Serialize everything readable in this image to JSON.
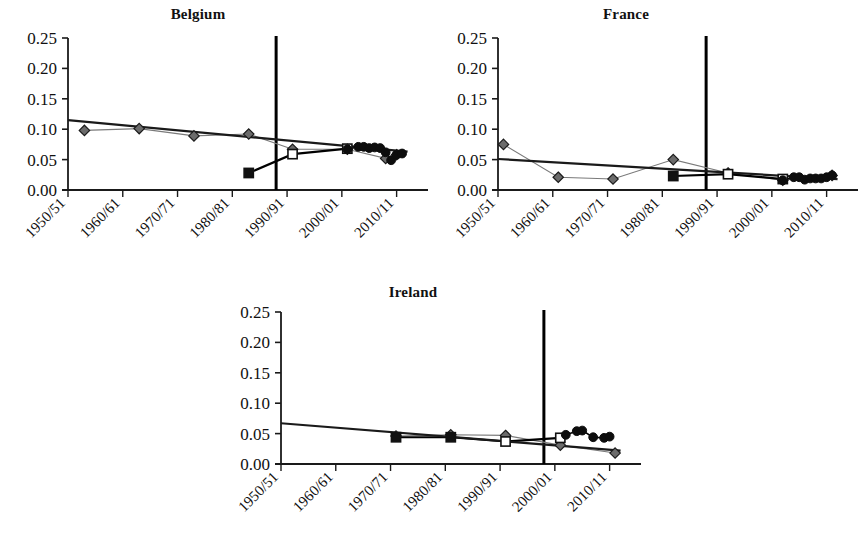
{
  "figure": {
    "panels": [
      {
        "id": "belgium",
        "title": "Belgium",
        "vline_year": "1988/89"
      },
      {
        "id": "france",
        "title": "France",
        "vline_year": "1988/89"
      },
      {
        "id": "ireland",
        "title": "Ireland",
        "vline_year": "1998/99"
      }
    ],
    "y_tick_labels": [
      "0.25",
      "0.20",
      "0.15",
      "0.10",
      "0.05",
      "0.00"
    ],
    "x_tick_labels": [
      "1950/51",
      "1960/61",
      "1970/71",
      "1980/81",
      "1990/91",
      "2000/01",
      "2010/11"
    ]
  },
  "chart_data": [
    {
      "type": "line",
      "title": "Belgium",
      "xlabel": "",
      "ylabel": "",
      "ylim": [
        0.0,
        0.25
      ],
      "yticks": [
        0.0,
        0.05,
        0.1,
        0.15,
        0.2,
        0.25
      ],
      "xlim": [
        1950,
        2015
      ],
      "xticks": [
        1950,
        1960,
        1970,
        1980,
        1990,
        2000,
        2010
      ],
      "xtick_labels": [
        "1950/51",
        "1960/61",
        "1970/71",
        "1980/81",
        "1990/91",
        "2000/01",
        "2010/11"
      ],
      "grid": false,
      "legend": "none",
      "annotations": [
        {
          "type": "vline",
          "x": 1988,
          "label": "structural break"
        }
      ],
      "series": [
        {
          "name": "diamond-series",
          "marker": "diamond",
          "color": "#555555",
          "x": [
            1953,
            1963,
            1973,
            1983,
            1991,
            2001,
            2008,
            2010
          ],
          "values": [
            0.098,
            0.101,
            0.089,
            0.092,
            0.067,
            0.067,
            0.052,
            0.058
          ]
        },
        {
          "name": "square-series",
          "marker": "square",
          "color": "#000000",
          "x": [
            1983,
            1991,
            2001
          ],
          "values": [
            0.028,
            0.059,
            0.068
          ]
        },
        {
          "name": "circle-series",
          "marker": "circle",
          "color": "#000000",
          "x": [
            2001,
            2003,
            2004,
            2005,
            2006,
            2007,
            2008,
            2009,
            2010,
            2011
          ],
          "values": [
            0.067,
            0.071,
            0.071,
            0.069,
            0.07,
            0.069,
            0.062,
            0.049,
            0.058,
            0.06
          ]
        },
        {
          "name": "trend-line",
          "marker": "none",
          "color": "#1a1a1a",
          "x": [
            1950,
            2012
          ],
          "values": [
            0.115,
            0.063
          ]
        }
      ]
    },
    {
      "type": "line",
      "title": "France",
      "xlabel": "",
      "ylabel": "",
      "ylim": [
        0.0,
        0.25
      ],
      "yticks": [
        0.0,
        0.05,
        0.1,
        0.15,
        0.2,
        0.25
      ],
      "xlim": [
        1950,
        2015
      ],
      "xticks": [
        1950,
        1960,
        1970,
        1980,
        1990,
        2000,
        2010
      ],
      "xtick_labels": [
        "1950/51",
        "1960/61",
        "1970/71",
        "1980/81",
        "1990/91",
        "2000/01",
        "2010/11"
      ],
      "grid": false,
      "legend": "none",
      "annotations": [
        {
          "type": "vline",
          "x": 1988,
          "label": "structural break"
        }
      ],
      "series": [
        {
          "name": "diamond-series",
          "marker": "diamond",
          "color": "#555555",
          "x": [
            1951,
            1961,
            1971,
            1982,
            1992,
            2002,
            2011
          ],
          "values": [
            0.075,
            0.021,
            0.018,
            0.05,
            0.028,
            0.016,
            0.024
          ]
        },
        {
          "name": "square-series",
          "marker": "square",
          "color": "#000000",
          "x": [
            1982,
            1992,
            2002
          ],
          "values": [
            0.023,
            0.026,
            0.018
          ]
        },
        {
          "name": "circle-series",
          "marker": "circle",
          "color": "#000000",
          "x": [
            2002,
            2004,
            2005,
            2006,
            2007,
            2008,
            2009,
            2010,
            2011
          ],
          "values": [
            0.016,
            0.021,
            0.021,
            0.017,
            0.019,
            0.019,
            0.019,
            0.021,
            0.024
          ]
        },
        {
          "name": "trend-line",
          "marker": "none",
          "color": "#1a1a1a",
          "x": [
            1950,
            2012
          ],
          "values": [
            0.051,
            0.018
          ]
        }
      ]
    },
    {
      "type": "line",
      "title": "Ireland",
      "xlabel": "",
      "ylabel": "",
      "ylim": [
        0.0,
        0.25
      ],
      "yticks": [
        0.0,
        0.05,
        0.1,
        0.15,
        0.2,
        0.25
      ],
      "xlim": [
        1950,
        2015
      ],
      "xticks": [
        1950,
        1960,
        1970,
        1980,
        1990,
        2000,
        2010
      ],
      "xtick_labels": [
        "1950/51",
        "1960/61",
        "1970/71",
        "1980/81",
        "1990/91",
        "2000/01",
        "2010/11"
      ],
      "grid": false,
      "legend": "none",
      "annotations": [
        {
          "type": "vline",
          "x": 1998,
          "label": "structural break"
        }
      ],
      "series": [
        {
          "name": "diamond-series",
          "marker": "diamond",
          "color": "#555555",
          "x": [
            1971,
            1981,
            1991,
            2001,
            2011
          ],
          "values": [
            0.046,
            0.048,
            0.047,
            0.031,
            0.018
          ]
        },
        {
          "name": "square-series",
          "marker": "square",
          "color": "#000000",
          "x": [
            1971,
            1981,
            1991,
            2001
          ],
          "values": [
            0.044,
            0.044,
            0.037,
            0.043
          ]
        },
        {
          "name": "circle-series",
          "marker": "circle",
          "color": "#000000",
          "x": [
            2002,
            2004,
            2005,
            2007,
            2009,
            2010
          ],
          "values": [
            0.048,
            0.054,
            0.055,
            0.044,
            0.043,
            0.045
          ]
        },
        {
          "name": "trend-line",
          "marker": "none",
          "color": "#1a1a1a",
          "x": [
            1950,
            2012
          ],
          "values": [
            0.067,
            0.022
          ]
        }
      ]
    }
  ]
}
